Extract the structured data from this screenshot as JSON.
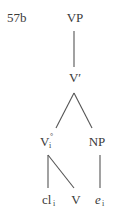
{
  "example_label": "57b",
  "tree": {
    "root": {
      "label": "VP"
    },
    "bar": {
      "label": "V′"
    },
    "left_node": {
      "label": "V",
      "subscript": "i",
      "superscript": "°"
    },
    "right_node": {
      "label": "NP"
    },
    "leaves": [
      {
        "label": "cl",
        "subscript": "i",
        "italic": false
      },
      {
        "label": "V",
        "subscript": "",
        "italic": false
      },
      {
        "label": "e",
        "subscript": "i",
        "italic": true
      }
    ]
  },
  "colors": {
    "text": "#3a3a3a",
    "lines": "#555555",
    "background": "#ffffff"
  }
}
